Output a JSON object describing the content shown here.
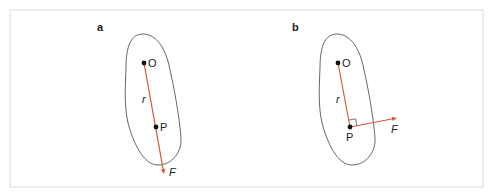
{
  "figure": {
    "frame": {
      "x": 10,
      "y": 10,
      "w": 473,
      "h": 177
    },
    "colors": {
      "vector": "#e0552f",
      "outline": "#555555",
      "frame": "#dbe3e3",
      "point": "#111111"
    },
    "panels": [
      {
        "id": "a",
        "label": "a",
        "label_pos": [
          97,
          31
        ],
        "blob_path": "M143,34 C131,34 126,46 126,68 C125,92 124,112 130,130 C136,148 145,165 158,165 C172,165 182,152 181,138 C180,124 176,96 170,70 C166,48 156,34 143,34 Z",
        "O": {
          "x": 144,
          "y": 63,
          "label": "O",
          "label_pos": [
            148,
            67
          ]
        },
        "P": {
          "x": 156,
          "y": 127,
          "label": "P",
          "label_pos": [
            160,
            131
          ]
        },
        "r_label": {
          "text": "r",
          "pos": [
            142,
            103
          ]
        },
        "force": {
          "from": [
            144,
            63
          ],
          "to": [
            164,
            174
          ],
          "label": "F",
          "label_pos": [
            169,
            176
          ]
        },
        "right_angle": false
      },
      {
        "id": "b",
        "label": "b",
        "label_pos": [
          292,
          31
        ],
        "blob_path": "M337,34 C325,34 320,46 320,68 C319,92 318,112 324,130 C330,148 339,165 352,165 C366,165 376,152 375,138 C374,124 370,96 364,70 C360,48 350,34 337,34 Z",
        "O": {
          "x": 338,
          "y": 63,
          "label": "O",
          "label_pos": [
            342,
            67
          ]
        },
        "P": {
          "x": 350,
          "y": 127,
          "label": "P",
          "label_pos": [
            346,
            141
          ]
        },
        "r_label": {
          "text": "r",
          "pos": [
            336,
            103
          ]
        },
        "r_line": {
          "from": [
            338,
            63
          ],
          "to": [
            350,
            127
          ]
        },
        "force": {
          "from": [
            350,
            127
          ],
          "to": [
            397,
            118
          ],
          "label": "F",
          "label_pos": [
            391,
            133
          ]
        },
        "right_angle": true
      }
    ]
  }
}
